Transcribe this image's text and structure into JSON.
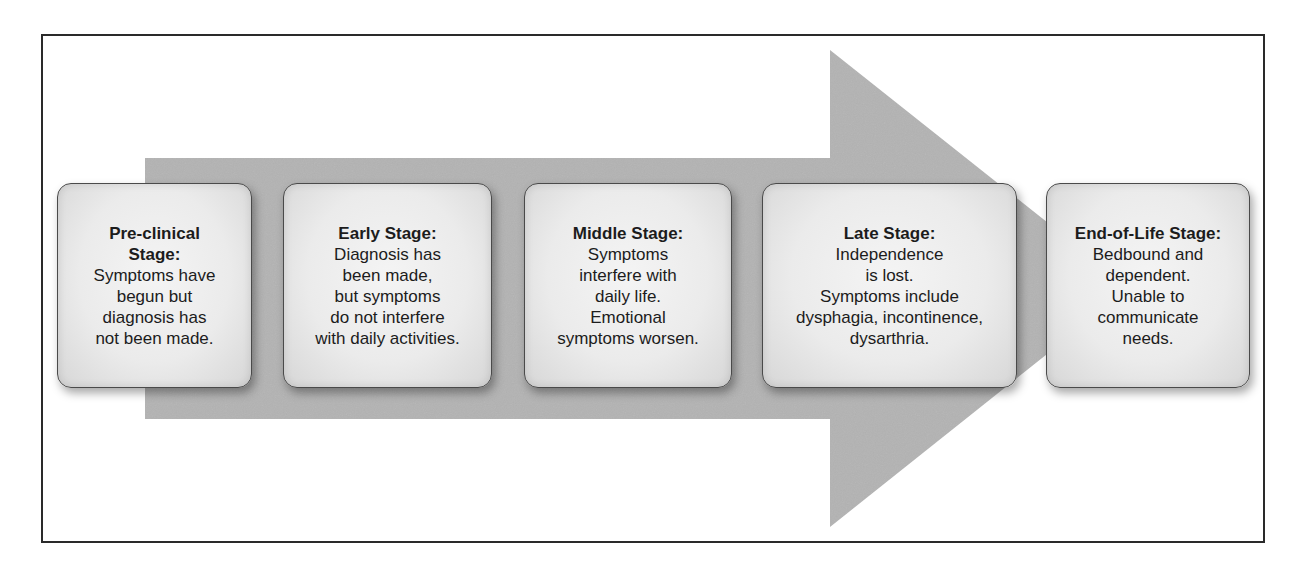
{
  "diagram": {
    "type": "progression-arrow",
    "arrow_color": "#b3b3b3",
    "box_border_color": "#4a4a4a",
    "frame_border_color": "#2a2a2a",
    "stages": [
      {
        "title": "Pre-clinical\nStage:",
        "description": "Symptoms have\nbegun but\ndiagnosis has\nnot been made."
      },
      {
        "title": "Early Stage:",
        "description": "Diagnosis has\nbeen made,\nbut symptoms\ndo not interfere\nwith daily activities."
      },
      {
        "title": "Middle Stage:",
        "description": "Symptoms\ninterfere with\ndaily life.\nEmotional\nsymptoms worsen."
      },
      {
        "title": "Late Stage:",
        "description": "Independence\nis lost.\nSymptoms include\ndysphagia, incontinence,\ndysarthria."
      },
      {
        "title": "End-of-Life Stage:",
        "description": "Bedbound and\ndependent.\nUnable to\ncommunicate\nneeds."
      }
    ]
  }
}
